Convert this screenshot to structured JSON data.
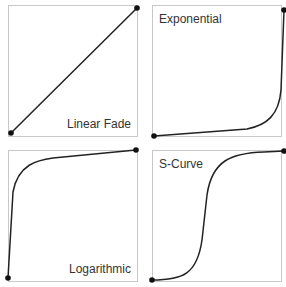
{
  "panels": [
    {
      "label": "Linear Fade",
      "curve": "linear"
    },
    {
      "label": "Exponential",
      "curve": "exponential"
    },
    {
      "label": "Logarithmic",
      "curve": "logarithmic"
    },
    {
      "label": "S-Curve",
      "curve": "s-curve"
    }
  ],
  "colors": {
    "line": "#222222",
    "border": "#c8c8c8",
    "text": "#333333"
  }
}
